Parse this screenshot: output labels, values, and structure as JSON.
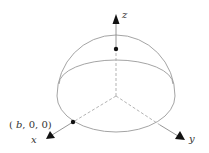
{
  "diagram": {
    "type": "hemisphere-coordinate-diagram",
    "axes": {
      "x": {
        "label": "x"
      },
      "y": {
        "label": "y"
      },
      "z": {
        "label": "z"
      }
    },
    "point_label": {
      "open": "(",
      "var": "b",
      "rest": ", 0, 0)"
    },
    "colors": {
      "curve": "#9a9a9a",
      "axis": "#8a8a8a",
      "dashed": "#aaaaaa",
      "arrow": "#111111",
      "point": "#111111"
    }
  }
}
